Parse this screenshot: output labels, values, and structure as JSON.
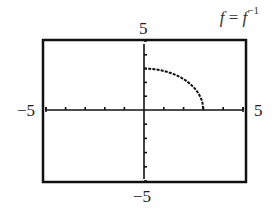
{
  "chart": {
    "title_lhs": "f",
    "title_eq": " = ",
    "title_rhs": "f",
    "title_sup": "−1",
    "labels": {
      "ymax": "5",
      "ymin": "−5",
      "xmin": "−5",
      "xmax": "5"
    }
  },
  "chart_data": {
    "type": "line",
    "xlabel": "",
    "ylabel": "",
    "xlim": [
      -5,
      5
    ],
    "ylim": [
      -5,
      5
    ],
    "x_tick_step": 1,
    "y_tick_step": 1,
    "grid": false,
    "legend": null,
    "series": [
      {
        "name": "f(x) = sqrt(9 - x^2), 0 <= x <= 3",
        "style": "dotted",
        "x": [
          0,
          0.5,
          1,
          1.5,
          2,
          2.5,
          2.8,
          3
        ],
        "y": [
          3,
          2.958,
          2.828,
          2.598,
          2.236,
          1.658,
          1.077,
          0
        ]
      }
    ],
    "annotations": [
      "f = f^-1"
    ]
  }
}
